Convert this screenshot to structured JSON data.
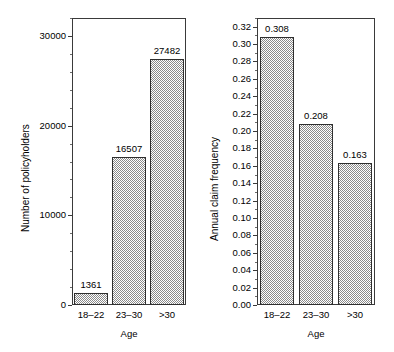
{
  "chart_data": [
    {
      "id": "policyholders",
      "type": "bar",
      "title": "",
      "xlabel": "Age",
      "ylabel": "Number of policyholders",
      "categories": [
        "18–22",
        "23–30",
        ">30"
      ],
      "values": [
        1361,
        16507,
        27482
      ],
      "value_labels": [
        "1361",
        "16507",
        "27482"
      ],
      "ylim": [
        0,
        32000
      ],
      "ytick_major": [
        0,
        10000,
        20000,
        30000
      ],
      "ytick_major_labels": [
        "0",
        "10000",
        "20000",
        "30000"
      ],
      "ytick_minor_step": 2000,
      "grid": false,
      "legend": "none",
      "bar_fill": "checkerboard-gray",
      "bar_edge_color": "#2e2e2e"
    },
    {
      "id": "claim-frequency",
      "type": "bar",
      "title": "",
      "xlabel": "Age",
      "ylabel": "Annual claim frequency",
      "categories": [
        "18–22",
        "23–30",
        ">30"
      ],
      "values": [
        0.308,
        0.208,
        0.163
      ],
      "value_labels": [
        "0.308",
        "0.208",
        "0.163"
      ],
      "ylim": [
        0.0,
        0.33
      ],
      "ytick_major": [
        0.0,
        0.02,
        0.04,
        0.06,
        0.08,
        0.1,
        0.12,
        0.14,
        0.16,
        0.18,
        0.2,
        0.22,
        0.24,
        0.26,
        0.28,
        0.3,
        0.32
      ],
      "ytick_major_labels": [
        "0.00",
        "0.02",
        "0.04",
        "0.06",
        "0.08",
        "0.10",
        "0.12",
        "0.14",
        "0.16",
        "0.18",
        "0.20",
        "0.22",
        "0.24",
        "0.26",
        "0.28",
        "0.30",
        "0.32"
      ],
      "ytick_minor_step": 0.01,
      "grid": false,
      "legend": "none",
      "bar_fill": "checkerboard-gray",
      "bar_edge_color": "#2e2e2e"
    }
  ],
  "colors": {
    "bar_pattern": "#8a8a8a",
    "bar_edge": "#2e2e2e",
    "frame": "#3a3a3a",
    "text": "#000000",
    "background": "#ffffff"
  }
}
